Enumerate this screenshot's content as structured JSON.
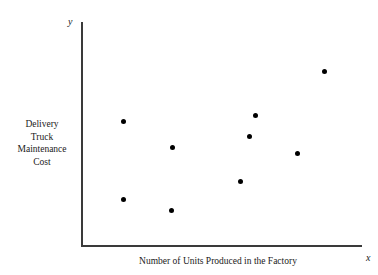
{
  "chart_data": {
    "type": "scatter",
    "title": "",
    "xlabel": "Number of Units Produced in the Factory",
    "ylabel": "Delivery Truck Maintenance Cost",
    "ylabel_lines": [
      "Delivery",
      "Truck",
      "Maintenance",
      "Cost"
    ],
    "x_axis_letter": "x",
    "y_axis_letter": "y",
    "grid": false,
    "legend": false,
    "xlim": [
      0,
      280
    ],
    "ylim": [
      0,
      223
    ],
    "x_tick_labels": [],
    "y_tick_labels": [],
    "point_color": "#000000",
    "axis_color": "#3a3a3a",
    "background_color": "#ffffff",
    "n_points": 9,
    "points": [
      {
        "px": 123,
        "py": 121,
        "x": 41,
        "y": 125
      },
      {
        "px": 172,
        "py": 147,
        "x": 90,
        "y": 99
      },
      {
        "px": 123,
        "py": 199,
        "x": 41,
        "y": 47
      },
      {
        "px": 171,
        "py": 210,
        "x": 89,
        "y": 36
      },
      {
        "px": 255,
        "py": 115,
        "x": 173,
        "y": 131
      },
      {
        "px": 249,
        "py": 136,
        "x": 167,
        "y": 110
      },
      {
        "px": 297,
        "py": 153,
        "x": 215,
        "y": 93
      },
      {
        "px": 240,
        "py": 181,
        "x": 158,
        "y": 65
      },
      {
        "px": 324,
        "py": 71,
        "x": 242,
        "y": 175
      }
    ]
  }
}
